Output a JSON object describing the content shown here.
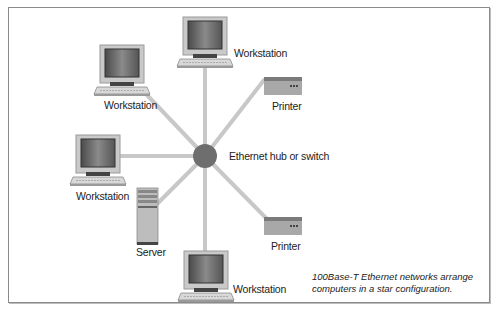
{
  "diagram": {
    "type": "star-network",
    "hub": {
      "label": "Ethernet hub or switch",
      "color": "#6e6e6e"
    },
    "link_color": "#c8c8c8",
    "nodes": [
      {
        "id": "ws-top",
        "kind": "workstation",
        "label": "Workstation"
      },
      {
        "id": "ws-upper-left",
        "kind": "workstation",
        "label": "Workstation"
      },
      {
        "id": "ws-left",
        "kind": "workstation",
        "label": "Workstation"
      },
      {
        "id": "ws-bottom",
        "kind": "workstation",
        "label": "Workstation"
      },
      {
        "id": "server",
        "kind": "server",
        "label": "Server"
      },
      {
        "id": "printer-top",
        "kind": "printer",
        "label": "Printer"
      },
      {
        "id": "printer-bottom",
        "kind": "printer",
        "label": "Printer"
      }
    ],
    "caption": {
      "line1": "100Base-T Ethernet networks arrange",
      "line2": "computers in a star configuration."
    }
  }
}
